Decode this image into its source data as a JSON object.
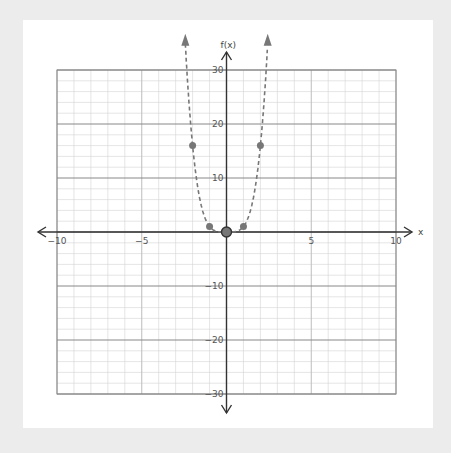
{
  "chart_data": {
    "type": "scatter",
    "title": "",
    "xlabel": "x",
    "ylabel": "f(x)",
    "xlim": [
      -10,
      10
    ],
    "ylim": [
      -30,
      30
    ],
    "x_ticks": [
      -10,
      -5,
      5,
      10
    ],
    "y_ticks": [
      30,
      20,
      10,
      -10,
      -20,
      -30
    ],
    "grid": true,
    "minor_grid": {
      "x_step": 1,
      "y_step": 2
    },
    "major_grid": {
      "x_step": 5,
      "y_step": 10
    },
    "series": [
      {
        "name": "f(x)",
        "style": "dashed curve with arrows",
        "function": "x^4",
        "points": [
          {
            "x": -2,
            "y": 16
          },
          {
            "x": -1,
            "y": 1
          },
          {
            "x": 0,
            "y": 0
          },
          {
            "x": 1,
            "y": 1
          },
          {
            "x": 2,
            "y": 16
          }
        ],
        "color": "#777777"
      }
    ],
    "highlighted_point": {
      "x": 0,
      "y": 0
    }
  },
  "labels": {
    "x_axis": "x",
    "y_axis": "f(x)",
    "x_ticks": [
      "−10",
      "−5",
      "5",
      "10"
    ],
    "y_ticks": [
      "30",
      "20",
      "10",
      "−10",
      "−20",
      "−30"
    ]
  },
  "colors": {
    "background": "#ececec",
    "card": "#ffffff",
    "grid_minor": "#d4d4d4",
    "grid_major": "#888888",
    "axis": "#333333",
    "curve": "#777777"
  }
}
